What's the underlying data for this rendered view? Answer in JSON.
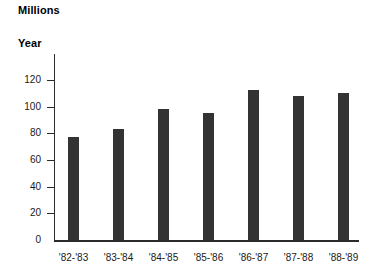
{
  "chart_data": {
    "type": "bar",
    "title": "Millions",
    "xlabel": "Year",
    "ylabel": "Millions",
    "categories": [
      "'82-'83",
      "'83-'84",
      "'84-'85",
      "'85-'86",
      "'86-'87",
      "'87-'88",
      "'88-'89"
    ],
    "values": [
      77,
      83,
      98,
      95,
      112,
      108,
      110
    ],
    "ylim": [
      0,
      130
    ],
    "yticks": [
      0,
      20,
      40,
      60,
      80,
      100,
      120
    ],
    "ytick_labels": [
      "0",
      "20",
      "40",
      "60",
      "80",
      "100",
      "120"
    ],
    "grid": false,
    "legend": null,
    "series": [
      {
        "name": "Millions",
        "values": [
          77,
          83,
          98,
          95,
          112,
          108,
          110
        ]
      }
    ],
    "colors": {
      "bar": "#333333",
      "axis": "#2b2b2b",
      "text": "#000000"
    }
  },
  "labels": {
    "units_title": "Millions",
    "year_title": "Year"
  }
}
